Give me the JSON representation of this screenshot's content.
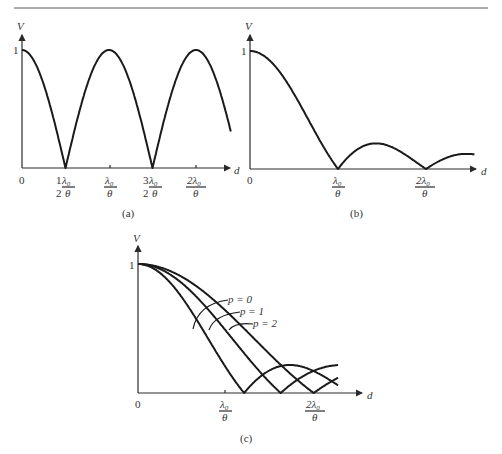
{
  "chart_data": [
    {
      "id": "a",
      "type": "line",
      "caption": "(a)",
      "ylabel": "V",
      "xlabel": "d",
      "y_tick_labels": [
        "1"
      ],
      "x_tick_labels": [
        "0",
        "1/2 λ0/θ",
        "λ0/θ",
        "3/2 λ0/θ",
        "2λ0/θ"
      ],
      "x": [
        0,
        0.25,
        0.5,
        0.75,
        1.0,
        1.25,
        1.5,
        1.75,
        2.0,
        2.25
      ],
      "values": [
        1.0,
        0.71,
        0.0,
        0.71,
        1.0,
        0.71,
        0.0,
        0.71,
        1.0,
        0.55
      ],
      "x_unit": "λ0/θ",
      "ylim": [
        0,
        1
      ],
      "description": "|cos(π d θ/λ0)| — zeros at 1/2 and 3/2 λ0/θ, maxima of 1 at 0, λ0/θ, 2λ0/θ"
    },
    {
      "id": "b",
      "type": "line",
      "caption": "(b)",
      "ylabel": "V",
      "xlabel": "d",
      "y_tick_labels": [
        "1"
      ],
      "x_tick_labels": [
        "0",
        "λ0/θ",
        "2λ0/θ"
      ],
      "x": [
        0,
        0.25,
        0.5,
        0.75,
        1.0,
        1.25,
        1.5,
        1.75,
        2.0,
        2.5
      ],
      "values": [
        1.0,
        0.9,
        0.64,
        0.3,
        0.0,
        0.17,
        0.22,
        0.13,
        0.0,
        0.12
      ],
      "x_unit": "λ0/θ",
      "ylim": [
        0,
        1
      ],
      "description": "|sinc(d θ/λ0)| — zeros at λ0/θ and 2λ0/θ, secondary lobe ≈0.22"
    },
    {
      "id": "c",
      "type": "line",
      "caption": "(c)",
      "ylabel": "V",
      "xlabel": "d",
      "y_tick_labels": [
        "1"
      ],
      "x_tick_labels": [
        "0",
        "λ0/θ",
        "2λ0/θ"
      ],
      "x_unit": "λ0/θ",
      "ylim": [
        0,
        1
      ],
      "series": [
        {
          "name": "p = 0",
          "x": [
            0,
            0.25,
            0.5,
            0.75,
            1.0,
            1.22,
            1.5,
            1.8,
            2.0,
            2.2
          ],
          "values": [
            1.0,
            0.93,
            0.74,
            0.43,
            0.15,
            0.0,
            0.06,
            0.09,
            0.07,
            0.04
          ]
        },
        {
          "name": "p = 1",
          "x": [
            0,
            0.25,
            0.5,
            0.75,
            1.0,
            1.25,
            1.5,
            1.64,
            1.85,
            2.2
          ],
          "values": [
            1.0,
            0.95,
            0.82,
            0.6,
            0.38,
            0.18,
            0.04,
            0.0,
            0.07,
            0.06
          ]
        },
        {
          "name": "p = 2",
          "x": [
            0,
            0.25,
            0.5,
            0.75,
            1.0,
            1.25,
            1.5,
            1.75,
            2.0,
            2.2
          ],
          "values": [
            1.0,
            0.96,
            0.86,
            0.7,
            0.5,
            0.3,
            0.14,
            0.05,
            0.0,
            0.03
          ]
        }
      ],
      "legend": [
        "p = 0",
        "p = 1",
        "p = 2"
      ],
      "legend_position": "annotations with leader lines"
    }
  ],
  "labels": {
    "v": "V",
    "d": "d",
    "one": "1",
    "zero": "0",
    "half": "1",
    "half_den": "2",
    "three": "3",
    "lambda": "λ",
    "sub0": "0",
    "theta": "θ",
    "two_lambda": "2λ",
    "cap_a": "(a)",
    "cap_b": "(b)",
    "cap_c": "(c)",
    "p0": "p = 0",
    "p1": "p = 1",
    "p2": "p = 2"
  }
}
